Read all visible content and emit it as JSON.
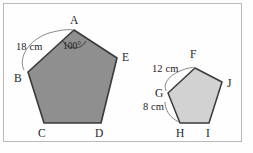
{
  "figure": {
    "background_color": "#fefefe",
    "frame_color": "#b9b9b9",
    "outline_color": "#3a3a3a"
  },
  "pentagon_large": {
    "name": "pentagon-abcde",
    "fill_color": "#8f8f8f",
    "vertices": [
      {
        "label": "A",
        "x": 74,
        "y": 30,
        "label_x": 70,
        "label_y": 15
      },
      {
        "label": "B",
        "x": 28,
        "y": 72,
        "label_x": 14,
        "label_y": 73
      },
      {
        "label": "C",
        "x": 44,
        "y": 123,
        "label_x": 38,
        "label_y": 128
      },
      {
        "label": "D",
        "x": 101,
        "y": 123,
        "label_x": 95,
        "label_y": 128
      },
      {
        "label": "E",
        "x": 117,
        "y": 58,
        "label_x": 122,
        "label_y": 52
      }
    ],
    "dimension": {
      "label": "18 cm",
      "side": "AB",
      "label_x": 16,
      "label_y": 42
    },
    "angle": {
      "label": "100°",
      "vertex": "A",
      "label_x": 63,
      "label_y": 42
    }
  },
  "pentagon_right": {
    "name": "pentagon-fghij",
    "fill_color": "#d2d2d2",
    "vertices": [
      {
        "label": "F",
        "x": 195,
        "y": 68,
        "label_x": 190,
        "label_y": 49
      },
      {
        "label": "G",
        "x": 168,
        "y": 93,
        "label_x": 155,
        "label_y": 88
      },
      {
        "label": "H",
        "x": 180,
        "y": 123,
        "label_x": 176,
        "label_y": 128
      },
      {
        "label": "I",
        "x": 209,
        "y": 123,
        "label_x": 206,
        "label_y": 128
      },
      {
        "label": "J",
        "x": 222,
        "y": 82,
        "label_x": 227,
        "label_y": 78
      }
    ],
    "dimensions": [
      {
        "label": "12 cm",
        "side": "FG",
        "label_x": 152,
        "label_y": 64
      },
      {
        "label": "8 cm",
        "side": "GH",
        "label_x": 143,
        "label_y": 102
      }
    ]
  }
}
